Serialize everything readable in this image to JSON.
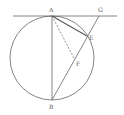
{
  "diagram": {
    "type": "geometry",
    "colors": {
      "stroke": "#666666",
      "label": "#555555",
      "background": "#ffffff"
    },
    "circle": {
      "cx": 52,
      "cy": 58,
      "r": 42
    },
    "points": {
      "A": {
        "label": "A",
        "x": 52,
        "y": 16
      },
      "B": {
        "label": "B",
        "x": 52,
        "y": 100
      },
      "G": {
        "label": "G",
        "x": 99,
        "y": 16
      },
      "E": {
        "label": "E",
        "x": 87,
        "y": 36
      },
      "F": {
        "label": "F",
        "x": 75,
        "y": 60
      }
    },
    "segments": [
      {
        "from": "tangent-start",
        "to": "tangent-end",
        "style": "solid",
        "note": "tangent at A"
      },
      {
        "from": "A",
        "to": "B",
        "style": "solid"
      },
      {
        "from": "B",
        "to": "G",
        "style": "solid"
      },
      {
        "from": "A",
        "to": "E",
        "style": "solid"
      },
      {
        "from": "A",
        "to": "F",
        "style": "dashed"
      }
    ]
  }
}
